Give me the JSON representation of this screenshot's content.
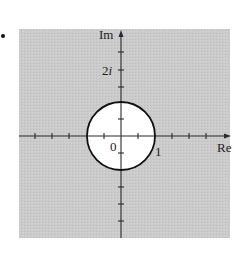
{
  "figure": {
    "bullet": "•",
    "axes": {
      "x_label": "Re",
      "y_label": "Im",
      "origin_label": "0",
      "x_tick_label": "1",
      "y_tick_label_num": "2",
      "y_tick_label_unit": "i"
    },
    "region": {
      "description": "|z| > 1",
      "shaded": "exterior of unit circle",
      "unshaded": "interior of unit circle (open disk)",
      "circle_radius": 1,
      "circle_center": [
        0,
        0
      ]
    },
    "tick_spacing": 0.5,
    "x_range": [
      -2.5,
      3.2
    ],
    "y_range": [
      -3.0,
      3.1
    ],
    "colors": {
      "shade": "#c9c9c9",
      "axis": "#2a2a2a",
      "circle_stroke": "#111111",
      "disk_fill": "#ffffff"
    }
  }
}
